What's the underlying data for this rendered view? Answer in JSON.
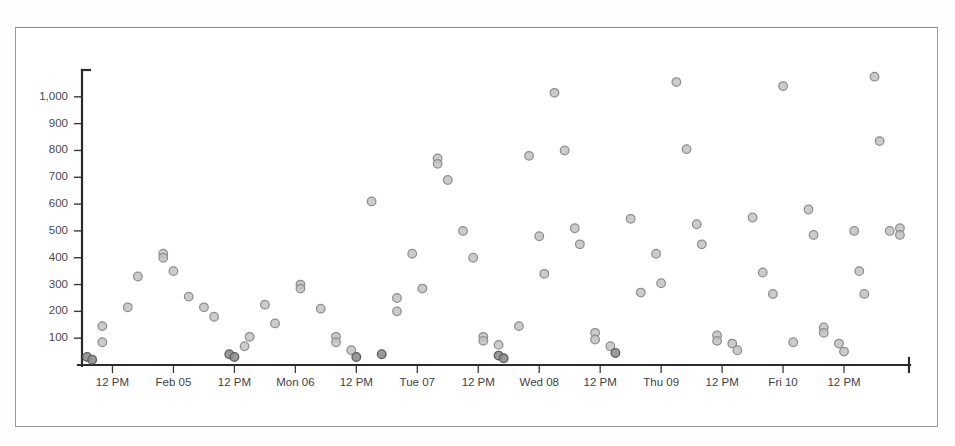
{
  "page": {
    "background_color": "#fefefe",
    "frame_color": "#9a9a9a"
  },
  "chart_data": {
    "type": "scatter",
    "title": "",
    "subtitle": "",
    "xlabel": "",
    "ylabel": "",
    "grid": false,
    "legend": null,
    "marker": {
      "shape": "circle",
      "fill_color": "#c2c2c2",
      "edge_color": "#8e8e8e",
      "radius_px": 4.3
    },
    "axis_color": "#2b2b2b",
    "ylim": [
      0,
      1100
    ],
    "ytick_values": [
      100,
      200,
      300,
      400,
      500,
      600,
      700,
      800,
      900,
      1000
    ],
    "ytick_labels": [
      "100",
      "200",
      "300",
      "400",
      "500",
      "600",
      "700",
      "800",
      "900",
      "1,000"
    ],
    "xtick_labels": [
      "12 PM",
      "Feb 05",
      "12 PM",
      "Mon 06",
      "12 PM",
      "Tue 07",
      "12 PM",
      "Wed 08",
      "12 PM",
      "Thu 09",
      "12 PM",
      "Fri 10",
      "12 PM"
    ],
    "xtick_positions_hours": [
      12,
      24,
      36,
      48,
      60,
      72,
      84,
      96,
      108,
      120,
      132,
      144,
      156
    ],
    "x_axis_type": "datetime",
    "x_range_hours": [
      6,
      168
    ],
    "points": [
      {
        "x": 7,
        "y": 30
      },
      {
        "x": 8,
        "y": 20
      },
      {
        "x": 10,
        "y": 85
      },
      {
        "x": 10,
        "y": 145
      },
      {
        "x": 15,
        "y": 215
      },
      {
        "x": 17,
        "y": 330
      },
      {
        "x": 22,
        "y": 415
      },
      {
        "x": 22,
        "y": 400
      },
      {
        "x": 24,
        "y": 350
      },
      {
        "x": 27,
        "y": 255
      },
      {
        "x": 30,
        "y": 215
      },
      {
        "x": 32,
        "y": 180
      },
      {
        "x": 35,
        "y": 40
      },
      {
        "x": 36,
        "y": 30
      },
      {
        "x": 38,
        "y": 70
      },
      {
        "x": 39,
        "y": 105
      },
      {
        "x": 42,
        "y": 225
      },
      {
        "x": 44,
        "y": 155
      },
      {
        "x": 49,
        "y": 300
      },
      {
        "x": 49,
        "y": 285
      },
      {
        "x": 53,
        "y": 210
      },
      {
        "x": 56,
        "y": 105
      },
      {
        "x": 56,
        "y": 85
      },
      {
        "x": 59,
        "y": 55
      },
      {
        "x": 60,
        "y": 30
      },
      {
        "x": 63,
        "y": 610
      },
      {
        "x": 65,
        "y": 40
      },
      {
        "x": 68,
        "y": 250
      },
      {
        "x": 68,
        "y": 200
      },
      {
        "x": 71,
        "y": 415
      },
      {
        "x": 73,
        "y": 285
      },
      {
        "x": 76,
        "y": 770
      },
      {
        "x": 76,
        "y": 750
      },
      {
        "x": 78,
        "y": 690
      },
      {
        "x": 81,
        "y": 500
      },
      {
        "x": 83,
        "y": 400
      },
      {
        "x": 85,
        "y": 105
      },
      {
        "x": 85,
        "y": 90
      },
      {
        "x": 88,
        "y": 75
      },
      {
        "x": 88,
        "y": 35
      },
      {
        "x": 89,
        "y": 25
      },
      {
        "x": 92,
        "y": 145
      },
      {
        "x": 94,
        "y": 780
      },
      {
        "x": 96,
        "y": 480
      },
      {
        "x": 97,
        "y": 340
      },
      {
        "x": 99,
        "y": 1015
      },
      {
        "x": 101,
        "y": 800
      },
      {
        "x": 103,
        "y": 510
      },
      {
        "x": 104,
        "y": 450
      },
      {
        "x": 107,
        "y": 120
      },
      {
        "x": 107,
        "y": 95
      },
      {
        "x": 110,
        "y": 70
      },
      {
        "x": 111,
        "y": 45
      },
      {
        "x": 114,
        "y": 545
      },
      {
        "x": 116,
        "y": 270
      },
      {
        "x": 119,
        "y": 415
      },
      {
        "x": 120,
        "y": 305
      },
      {
        "x": 123,
        "y": 1055
      },
      {
        "x": 125,
        "y": 805
      },
      {
        "x": 127,
        "y": 525
      },
      {
        "x": 128,
        "y": 450
      },
      {
        "x": 131,
        "y": 110
      },
      {
        "x": 131,
        "y": 90
      },
      {
        "x": 134,
        "y": 80
      },
      {
        "x": 135,
        "y": 55
      },
      {
        "x": 138,
        "y": 550
      },
      {
        "x": 140,
        "y": 345
      },
      {
        "x": 142,
        "y": 265
      },
      {
        "x": 144,
        "y": 1040
      },
      {
        "x": 146,
        "y": 85
      },
      {
        "x": 149,
        "y": 580
      },
      {
        "x": 150,
        "y": 485
      },
      {
        "x": 152,
        "y": 140
      },
      {
        "x": 152,
        "y": 120
      },
      {
        "x": 155,
        "y": 80
      },
      {
        "x": 156,
        "y": 50
      },
      {
        "x": 158,
        "y": 500
      },
      {
        "x": 159,
        "y": 350
      },
      {
        "x": 160,
        "y": 265
      },
      {
        "x": 162,
        "y": 1075
      },
      {
        "x": 163,
        "y": 835
      },
      {
        "x": 165,
        "y": 500
      },
      {
        "x": 167,
        "y": 510
      },
      {
        "x": 167,
        "y": 485
      }
    ]
  }
}
